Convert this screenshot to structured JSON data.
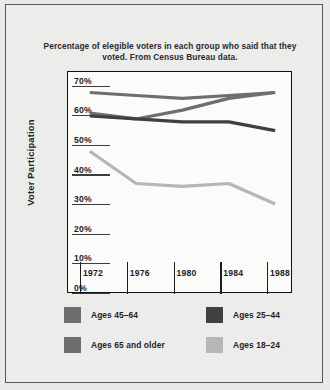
{
  "chart_data": {
    "type": "line",
    "title": "Percentage of elegible voters in each group who said that they voted. From Census Bureau data.",
    "xlabel": "",
    "ylabel": "Voter Participation",
    "x": [
      1972,
      1976,
      1980,
      1984,
      1988
    ],
    "xtick_labels": [
      "1972",
      "1976",
      "1980",
      "1984",
      "1988"
    ],
    "ytick_labels": [
      "0%",
      "10%",
      "20%",
      "30%",
      "40%",
      "50%",
      "60%",
      "70%"
    ],
    "ytick_values": [
      0,
      10,
      20,
      30,
      40,
      50,
      60,
      70
    ],
    "ylim": [
      0,
      75
    ],
    "grid": false,
    "legend_position": "bottom",
    "series": [
      {
        "name": "Ages 45–64",
        "color": "#6e6e70",
        "values": [
          68,
          67,
          66,
          67,
          68
        ]
      },
      {
        "name": "Ages 65 and older",
        "color": "#6e6e70",
        "values": [
          61,
          59,
          62,
          66,
          68
        ]
      },
      {
        "name": "Ages 25–44",
        "color": "#3f3f41",
        "values": [
          60,
          59,
          58,
          58,
          55
        ]
      },
      {
        "name": "Ages 18–24",
        "color": "#b6b6b6",
        "values": [
          48,
          37,
          36,
          37,
          30
        ]
      }
    ]
  },
  "legend": {
    "items": [
      {
        "label": "Ages 45–64",
        "color": "#6e6e70"
      },
      {
        "label": "Ages 25–44",
        "color": "#3f3f41"
      },
      {
        "label": "Ages 65 and older",
        "color": "#6e6e70"
      },
      {
        "label": "Ages 18–24",
        "color": "#b6b6b6"
      }
    ]
  }
}
